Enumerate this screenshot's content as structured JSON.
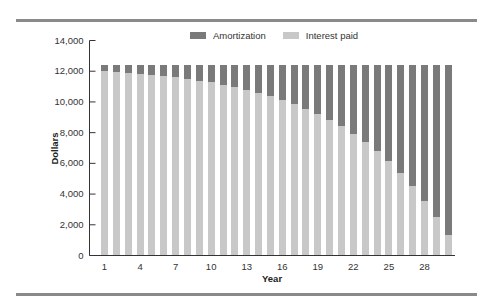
{
  "legend": {
    "items": [
      {
        "label": "Amortization",
        "color": "#7a7a7a"
      },
      {
        "label": "Interest paid",
        "color": "#c8c8c8"
      }
    ]
  },
  "chart_data": {
    "type": "bar",
    "stacked": true,
    "title": "",
    "xlabel": "Year",
    "ylabel": "Dollars",
    "ylim": [
      0,
      14000
    ],
    "yticks": [
      "0",
      "2,000",
      "4,000",
      "6,000",
      "8,000",
      "10,000",
      "12,000",
      "14,000"
    ],
    "yticks_values": [
      0,
      2000,
      4000,
      6000,
      8000,
      10000,
      12000,
      14000
    ],
    "xtick_labels": [
      "1",
      "4",
      "7",
      "10",
      "13",
      "16",
      "19",
      "22",
      "25",
      "28"
    ],
    "xtick_positions": [
      1,
      4,
      7,
      10,
      13,
      16,
      19,
      22,
      25,
      28
    ],
    "categories": [
      1,
      2,
      3,
      4,
      5,
      6,
      7,
      8,
      9,
      10,
      11,
      12,
      13,
      14,
      15,
      16,
      17,
      18,
      19,
      20,
      21,
      22,
      23,
      24,
      25,
      26,
      27,
      28,
      29,
      30
    ],
    "legend_position": "top",
    "grid": false,
    "series": [
      {
        "name": "Interest paid",
        "color": "#c8c8c8",
        "values": [
          12000,
          11950,
          11894,
          11832,
          11762,
          11684,
          11596,
          11498,
          11388,
          11265,
          11127,
          10973,
          10800,
          10606,
          10389,
          10146,
          9874,
          9569,
          9228,
          8845,
          8417,
          7937,
          7400,
          6798,
          6125,
          5370,
          4525,
          3578,
          2518,
          1330
        ]
      },
      {
        "name": "Amortization",
        "color": "#7a7a7a",
        "values": [
          414,
          464,
          520,
          582,
          652,
          730,
          818,
          916,
          1026,
          1149,
          1287,
          1441,
          1614,
          1808,
          2025,
          2268,
          2540,
          2845,
          3186,
          3569,
          3997,
          4477,
          5014,
          5616,
          6289,
          7044,
          7889,
          8836,
          9896,
          11084
        ]
      }
    ]
  }
}
